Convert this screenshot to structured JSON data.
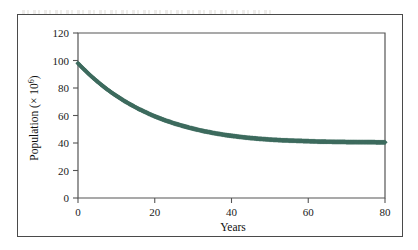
{
  "figure": {
    "background_color": "#ffffff",
    "border_color": "#4a4a4a",
    "artifact_name": "faint-scan-bleedthrough"
  },
  "chart_data": {
    "type": "scatter",
    "title": "",
    "xlabel": "Years",
    "ylabel": "Population (× 10⁶)",
    "ylabel_base": "Population (× 10",
    "ylabel_exponent": "6",
    "ylabel_close": ")",
    "xlim": [
      0,
      80
    ],
    "ylim": [
      0,
      120
    ],
    "xticks": [
      0,
      20,
      40,
      60,
      80
    ],
    "yticks": [
      0,
      20,
      40,
      60,
      80,
      100,
      120
    ],
    "xtick_labels": [
      "0",
      "20",
      "40",
      "60",
      "80"
    ],
    "ytick_labels": [
      "0",
      "20",
      "40",
      "60",
      "80",
      "100",
      "120"
    ],
    "grid": false,
    "legend": false,
    "marker": "diamond",
    "marker_color": "#3d6b5e",
    "marker_size": 2.6,
    "series": [
      {
        "name": "Population",
        "x": [
          0,
          1,
          2,
          3,
          4,
          5,
          6,
          7,
          8,
          9,
          10,
          11,
          12,
          13,
          14,
          15,
          16,
          17,
          18,
          19,
          20,
          21,
          22,
          23,
          24,
          25,
          26,
          27,
          28,
          29,
          30,
          31,
          32,
          33,
          34,
          35,
          36,
          37,
          38,
          39,
          40,
          41,
          42,
          43,
          44,
          45,
          46,
          47,
          48,
          49,
          50,
          51,
          52,
          53,
          54,
          55,
          56,
          57,
          58,
          59,
          60,
          61,
          62,
          63,
          64,
          65,
          66,
          67,
          68,
          69,
          70,
          71,
          72,
          73,
          74,
          75,
          76,
          77,
          78,
          79,
          80
        ],
        "y": [
          98.0,
          95.1,
          92.4,
          89.7,
          87.2,
          84.8,
          82.5,
          80.3,
          78.2,
          76.2,
          74.3,
          72.5,
          70.7,
          69.1,
          67.5,
          66.0,
          64.5,
          63.2,
          61.9,
          60.6,
          59.4,
          58.3,
          57.2,
          56.2,
          55.3,
          54.3,
          53.5,
          52.7,
          51.9,
          51.1,
          50.4,
          49.8,
          49.1,
          48.5,
          48.0,
          47.4,
          46.9,
          46.5,
          46.0,
          45.6,
          45.2,
          44.9,
          44.5,
          44.2,
          43.9,
          43.6,
          43.4,
          43.1,
          42.9,
          42.7,
          42.5,
          42.3,
          42.2,
          42.0,
          41.9,
          41.8,
          41.7,
          41.6,
          41.5,
          41.4,
          41.3,
          41.2,
          41.1,
          41.0,
          41.0,
          40.9,
          40.9,
          40.8,
          40.8,
          40.8,
          40.7,
          40.7,
          40.7,
          40.6,
          40.6,
          40.6,
          40.6,
          40.6,
          40.5,
          40.5,
          40.5
        ]
      }
    ]
  }
}
